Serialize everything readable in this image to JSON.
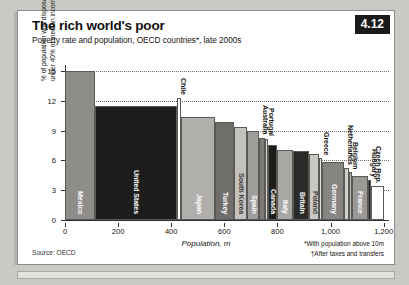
{
  "header": {
    "title": "The rich world's poor",
    "subtitle": "Poverty rate and population, OECD countries*, late 2000s",
    "badge": "4.12"
  },
  "footer": {
    "source": "Source: OECD",
    "footnote_1": "*With population above 10m",
    "footnote_2": "†After taxes and transfers"
  },
  "chart_data": {
    "type": "bar",
    "title": "The rich world's poor",
    "subtitle": "Poverty rate and population, OECD countries*, late 2000s",
    "xlabel": "Population, m",
    "ylabel": "% of population with disposable income under 40% of median income†",
    "xlim": [
      0,
      1220
    ],
    "ylim": [
      0,
      15.6
    ],
    "xticks": [
      0,
      200,
      400,
      600,
      800,
      1000,
      1200
    ],
    "xticklabels": [
      "0",
      "200",
      "400",
      "600",
      "800",
      "1,000",
      "1,200"
    ],
    "yticks": [
      0,
      3,
      6,
      9,
      12,
      15
    ],
    "yticklabels": [
      "0",
      "3",
      "6",
      "9",
      "12",
      "15"
    ],
    "grid": "horizontal-dotted",
    "legend": "none",
    "note": "Variable-width (Marimekko) bars: width = population in millions, height = poverty rate",
    "bars": [
      {
        "label": "Mexico",
        "x0": 0,
        "width": 112,
        "value": 15.0,
        "color": "#8e8d89",
        "text_color": "#ffffff"
      },
      {
        "label": "United States",
        "x0": 112,
        "width": 308,
        "value": 11.5,
        "color": "#1d1d1b",
        "text_color": "#ffffff"
      },
      {
        "label": "Chile",
        "x0": 420,
        "width": 17,
        "value": 12.3,
        "color": "#ffffff",
        "text_color": "#1d1d1b"
      },
      {
        "label": "Japan",
        "x0": 437,
        "width": 128,
        "value": 10.4,
        "color": "#b0afab",
        "text_color": "#ffffff"
      },
      {
        "label": "Turkey",
        "x0": 565,
        "width": 72,
        "value": 9.9,
        "color": "#6f6e6a",
        "text_color": "#ffffff"
      },
      {
        "label": "South Korea",
        "x0": 637,
        "width": 49,
        "value": 9.4,
        "color": "#c3c2be",
        "text_color": "#3a3935"
      },
      {
        "label": "Spain",
        "x0": 686,
        "width": 46,
        "value": 9.0,
        "color": "#9e9d99",
        "text_color": "#ffffff"
      },
      {
        "label": "Australia",
        "x0": 732,
        "width": 22,
        "value": 8.3,
        "color": "#7c7b77",
        "text_color": "#ffffff"
      },
      {
        "label": "Portugal",
        "x0": 754,
        "width": 11,
        "value": 8.2,
        "color": "#d8d7d3",
        "text_color": "#3a3935"
      },
      {
        "label": "Canada",
        "x0": 765,
        "width": 33,
        "value": 7.5,
        "color": "#1d1d1b",
        "text_color": "#ffffff"
      },
      {
        "label": "Italy",
        "x0": 798,
        "width": 60,
        "value": 7.0,
        "color": "#a8a7a3",
        "text_color": "#ffffff"
      },
      {
        "label": "Britain",
        "x0": 858,
        "width": 62,
        "value": 6.9,
        "color": "#2b2b29",
        "text_color": "#ffffff"
      },
      {
        "label": "Poland",
        "x0": 920,
        "width": 38,
        "value": 6.6,
        "color": "#c9c8c4",
        "text_color": "#3a3935"
      },
      {
        "label": "Greece",
        "x0": 958,
        "width": 11,
        "value": 6.2,
        "color": "#e6e5e1",
        "text_color": "#3a3935"
      },
      {
        "label": "Germany",
        "x0": 969,
        "width": 82,
        "value": 5.8,
        "color": "#868581",
        "text_color": "#ffffff"
      },
      {
        "label": "Netherlands",
        "x0": 1051,
        "width": 17,
        "value": 5.2,
        "color": "#cfcecA",
        "text_color": "#3a3935"
      },
      {
        "label": "Belgium",
        "x0": 1068,
        "width": 11,
        "value": 4.8,
        "color": "#b6b5b1",
        "text_color": "#3a3935"
      },
      {
        "label": "France",
        "x0": 1079,
        "width": 63,
        "value": 4.4,
        "color": "#9a9995",
        "text_color": "#ffffff"
      },
      {
        "label": "Hungary",
        "x0": 1142,
        "width": 10,
        "value": 4.0,
        "color": "#1d1d1b",
        "text_color": "#ffffff"
      },
      {
        "label": "Czech Rep.",
        "x0": 1152,
        "width": 48,
        "value": 3.4,
        "color": "#ffffff",
        "text_color": "#1d1d1b"
      }
    ]
  }
}
